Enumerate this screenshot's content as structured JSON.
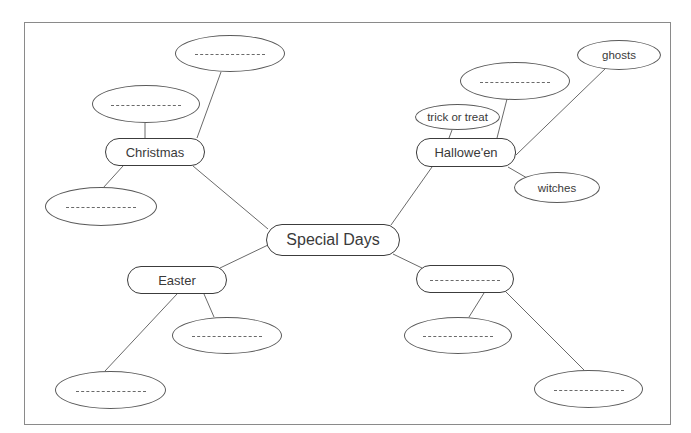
{
  "diagram": {
    "type": "mind-map",
    "center": {
      "label": "Special Days"
    },
    "branches": [
      {
        "label": "Christmas",
        "children": [
          {
            "label": "",
            "blank": true
          },
          {
            "label": "",
            "blank": true
          },
          {
            "label": "",
            "blank": true
          }
        ]
      },
      {
        "label": "Hallowe'en",
        "children": [
          {
            "label": "trick or treat"
          },
          {
            "label": "",
            "blank": true
          },
          {
            "label": "ghosts"
          },
          {
            "label": "witches"
          }
        ]
      },
      {
        "label": "Easter",
        "children": [
          {
            "label": "",
            "blank": true
          },
          {
            "label": "",
            "blank": true
          }
        ]
      },
      {
        "label": "",
        "blank": true,
        "children": [
          {
            "label": "",
            "blank": true
          },
          {
            "label": "",
            "blank": true
          }
        ]
      }
    ],
    "blank_placeholder": "---------",
    "colors": {
      "line": "#6a6a6a",
      "border": "#3c3c3c",
      "text": "#3a3a3a",
      "background": "#ffffff"
    }
  }
}
